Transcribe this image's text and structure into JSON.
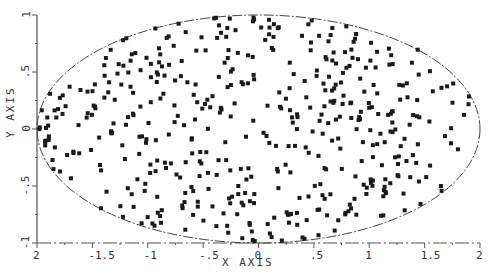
{
  "chart_data": {
    "type": "scatter",
    "title": "",
    "xlabel": "X AXIS",
    "ylabel": "Y AXIS",
    "xlim": [
      -2,
      2
    ],
    "ylim": [
      -1,
      1
    ],
    "grid": false,
    "legend": null,
    "boundary": {
      "shape": "ellipse",
      "center": [
        0,
        0
      ],
      "semi_axis_x": 2,
      "semi_axis_y": 1,
      "style": "dashed"
    },
    "x_ticks": [
      -2,
      -1.5,
      -1,
      -0.5,
      0,
      0.5,
      1,
      1.5,
      2
    ],
    "x_tick_labels": [
      "2",
      "-1.5",
      "-1",
      "-.5",
      "0",
      ".5",
      "1",
      "1.5",
      "2"
    ],
    "y_ticks": [
      -1,
      -0.5,
      0,
      0.5,
      1
    ],
    "y_tick_labels": [
      "-1",
      "-.5",
      "0",
      ".5",
      "1"
    ],
    "marker": "square",
    "approx_point_count": 480,
    "sample_points": [
      {
        "x": -1.75,
        "y": 0.08
      },
      {
        "x": -1.9,
        "y": 0.0
      },
      {
        "x": -1.6,
        "y": 0.35
      },
      {
        "x": -1.2,
        "y": 0.55
      },
      {
        "x": -0.9,
        "y": 0.7
      },
      {
        "x": -0.6,
        "y": 0.8
      },
      {
        "x": -0.3,
        "y": 0.9
      },
      {
        "x": 0.05,
        "y": 0.93
      },
      {
        "x": 0.35,
        "y": 0.85
      },
      {
        "x": 0.7,
        "y": 0.7
      },
      {
        "x": 1.1,
        "y": 0.62
      },
      {
        "x": 1.45,
        "y": 0.5
      },
      {
        "x": 1.8,
        "y": 0.3
      },
      {
        "x": 1.95,
        "y": -0.05
      },
      {
        "x": 1.75,
        "y": -0.4
      },
      {
        "x": 1.4,
        "y": -0.6
      },
      {
        "x": 1.0,
        "y": -0.75
      },
      {
        "x": 0.6,
        "y": -0.9
      },
      {
        "x": 0.2,
        "y": -0.93
      },
      {
        "x": -0.3,
        "y": -0.9
      },
      {
        "x": -0.7,
        "y": -0.8
      },
      {
        "x": -1.2,
        "y": -0.65
      },
      {
        "x": -1.6,
        "y": -0.45
      },
      {
        "x": -1.0,
        "y": 0.1
      },
      {
        "x": -0.5,
        "y": -0.2
      },
      {
        "x": 0.0,
        "y": 0.3
      },
      {
        "x": 0.4,
        "y": -0.3
      },
      {
        "x": 0.9,
        "y": 0.2
      },
      {
        "x": 1.3,
        "y": -0.1
      },
      {
        "x": -0.2,
        "y": 0.6
      }
    ]
  },
  "render": {
    "seed": 1987,
    "count": 480,
    "colors": {
      "points": "#1a1a1a",
      "axes": "#555555",
      "ellipse": "#444444"
    }
  }
}
